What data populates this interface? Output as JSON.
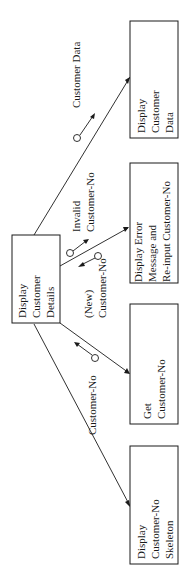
{
  "diagram": {
    "type": "structure-chart",
    "orientation": "rotated-90-ccw",
    "colors": {
      "ink": "#1a1a1a",
      "background": "#ffffff"
    },
    "root": {
      "lines": [
        "Display",
        "Customer",
        "Details"
      ]
    },
    "modules": [
      {
        "id": "display-customer-data",
        "lines": [
          "Display",
          "Customer",
          "Data"
        ]
      },
      {
        "id": "display-error",
        "lines": [
          "Display Error",
          "Message and",
          "Re-input Customer-No"
        ]
      },
      {
        "id": "get-customer-no",
        "lines": [
          "Get",
          "Customer-No"
        ]
      },
      {
        "id": "display-skeleton",
        "lines": [
          "Display",
          "Customer-No",
          "Skeleton"
        ]
      }
    ],
    "couples": [
      {
        "id": "customer-data",
        "lines": [
          "Customer Data"
        ],
        "direction": "to-module",
        "target": "display-customer-data"
      },
      {
        "id": "invalid-customer-no",
        "lines": [
          "Invalid",
          "Customer-No"
        ],
        "direction": "to-module",
        "target": "display-error"
      },
      {
        "id": "new-customer-no",
        "lines": [
          "(New)",
          "Customer-No"
        ],
        "direction": "to-root",
        "target": "display-error"
      },
      {
        "id": "customer-no",
        "lines": [
          "Customer-No"
        ],
        "direction": "to-root",
        "target": "get-customer-no"
      }
    ]
  }
}
